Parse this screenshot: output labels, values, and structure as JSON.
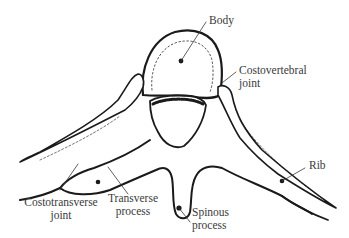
{
  "figure": {
    "colors": {
      "ink": "#1a1a1a",
      "label": "#3a3a3a",
      "background": "#ffffff"
    },
    "labels": {
      "body": "Body",
      "costovertebral_line1": "Costovertebral",
      "costovertebral_line2": "joint",
      "rib": "Rib",
      "costotransverse_line1": "Costotransverse",
      "costotransverse_line2": "joint",
      "transverse_line1": "Transverse",
      "transverse_line2": "process",
      "spinous_line1": "Spinous",
      "spinous_line2": "process"
    }
  }
}
